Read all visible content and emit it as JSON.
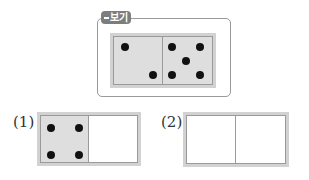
{
  "example": {
    "badge_label": "보기",
    "domino": {
      "left_pips": 2,
      "right_pips": 5,
      "left_filled": true,
      "right_filled": true
    }
  },
  "problems": [
    {
      "label": "(1)",
      "domino": {
        "left_pips": 4,
        "right_pips": 0,
        "left_filled": true,
        "right_filled": false
      }
    },
    {
      "label": "(2)",
      "domino": {
        "left_pips": 0,
        "right_pips": 0,
        "left_filled": false,
        "right_filled": false
      }
    }
  ],
  "colors": {
    "filled_half": "#dedede",
    "domino_border": "#d2d2d2",
    "frame": "#9a9a9a",
    "badge": "#7d7d7d",
    "pip": "#111111"
  }
}
